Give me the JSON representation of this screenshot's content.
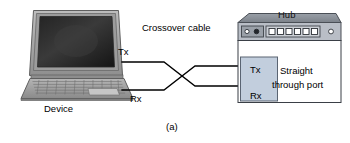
{
  "figure": {
    "caption": "(a)",
    "labels": {
      "device": "Device",
      "tx_device": "Tx",
      "rx_device": "Rx",
      "cable": "Crossover cable",
      "hub_title": "Hub",
      "tx_hub": "Tx",
      "rx_hub": "Rx",
      "port_line1": "Straight",
      "port_line2": "through port"
    },
    "colors": {
      "line": "#000000",
      "port_panel_fill": "#c2cedd",
      "port_panel_stroke": "#5a6472",
      "hub_body_fill": "#ffffff",
      "hub_body_stroke": "#3a3f46",
      "hub_top_fill": "#8e949c",
      "hub_panel_fill": "#b9bec6",
      "laptop_case_fill": "#a9a9a9",
      "laptop_screen_fill": "#1c1c1c",
      "keyboard_fill": "#9a9a9a",
      "text": "#000000"
    },
    "hub_panel": {
      "led_count": 2,
      "port_count": 6,
      "aux_port_count": 1
    }
  }
}
